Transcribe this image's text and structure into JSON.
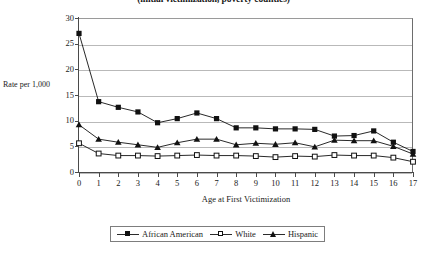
{
  "chart_data": {
    "type": "line",
    "title": "(initial victimization, poverty counties)",
    "xlabel": "Age at First Victimization",
    "ylabel": "Rate per 1,000",
    "x": [
      0,
      1,
      2,
      3,
      4,
      5,
      6,
      7,
      8,
      9,
      10,
      11,
      12,
      13,
      14,
      15,
      16,
      17
    ],
    "xlim": [
      0,
      17
    ],
    "ylim": [
      0,
      30
    ],
    "yticks": [
      0,
      5,
      10,
      15,
      20,
      25,
      30
    ],
    "xticks": [
      0,
      1,
      2,
      3,
      4,
      5,
      6,
      7,
      8,
      9,
      10,
      11,
      12,
      13,
      14,
      15,
      16,
      17
    ],
    "grid": true,
    "legend_position": "bottom",
    "series": [
      {
        "name": "African American",
        "marker": "filled-square",
        "color": "#111111",
        "values": [
          27.0,
          13.7,
          12.6,
          11.7,
          9.6,
          10.4,
          11.5,
          10.4,
          8.6,
          8.6,
          8.4,
          8.4,
          8.3,
          7.0,
          7.1,
          8.0,
          5.8,
          4.0
        ]
      },
      {
        "name": "White",
        "marker": "open-square",
        "color": "#111111",
        "values": [
          5.6,
          3.6,
          3.2,
          3.2,
          3.1,
          3.2,
          3.3,
          3.2,
          3.2,
          3.1,
          2.9,
          3.1,
          3.0,
          3.3,
          3.2,
          3.2,
          2.8,
          2.0
        ]
      },
      {
        "name": "Hispanic",
        "marker": "filled-triangle",
        "color": "#111111",
        "values": [
          9.2,
          6.4,
          5.8,
          5.3,
          4.8,
          5.7,
          6.4,
          6.4,
          5.3,
          5.6,
          5.4,
          5.7,
          4.9,
          6.2,
          6.1,
          6.1,
          5.0,
          3.5
        ]
      }
    ]
  },
  "legend": {
    "items": [
      {
        "label": "African American"
      },
      {
        "label": "White"
      },
      {
        "label": "Hispanic"
      }
    ]
  }
}
